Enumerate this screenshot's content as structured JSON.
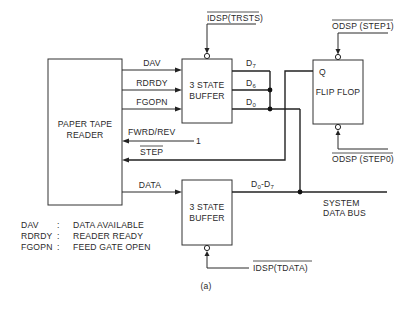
{
  "figure": {
    "caption": "(a)",
    "blocks": {
      "reader": {
        "line1": "PAPER TAPE",
        "line2": "READER"
      },
      "buffer_top": {
        "line1": "3 STATE",
        "line2": "BUFFER"
      },
      "buffer_bottom": {
        "line1": "3 STATE",
        "line2": "BUFFER"
      },
      "flip_flop": {
        "label": "FLIP FLOP",
        "output": "Q"
      }
    },
    "signals": {
      "dav": "DAV",
      "rdrdy": "RDRDY",
      "fgopn": "FGOPN",
      "fwrd_rev": "FWRD/REV",
      "fwrd_rev_value": "1",
      "step": "STEP",
      "data": "DATA",
      "d7": {
        "base": "D",
        "sub": "7"
      },
      "d6": {
        "base": "D",
        "sub": "6"
      },
      "d0": {
        "base": "D",
        "sub": "0"
      },
      "d0_d7": {
        "base1": "D",
        "sub1": "0",
        "dash": "-",
        "base2": "D",
        "sub2": "7"
      },
      "idsp_trsts": "IDSP(TRSTS)",
      "odsp_step1": "ODSP (STEP1)",
      "odsp_step0": "ODSP (STEP0)",
      "idsp_tdata": "IDSP(TDATA)",
      "system_bus_line1": "SYSTEM",
      "system_bus_line2": "DATA BUS"
    },
    "legend": [
      {
        "abbr": "DAV",
        "sep": ":",
        "meaning": "DATA AVAILABLE"
      },
      {
        "abbr": "RDRDY",
        "sep": ":",
        "meaning": "READER READY"
      },
      {
        "abbr": "FGOPN",
        "sep": ":",
        "meaning": "FEED GATE OPEN"
      }
    ]
  }
}
